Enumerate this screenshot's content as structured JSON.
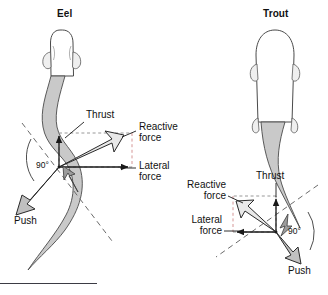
{
  "figure": {
    "background": "#ffffff",
    "ink": "#1a1a1a",
    "body_fill": "#c9c9c9",
    "body_stroke": "#4a4a4a",
    "dash_color": "#6b6b6b",
    "arrow_fill": "#b5b5b5"
  },
  "panels": [
    {
      "id": "eel",
      "title": "Eel",
      "orientation": "tail-sweeps-left",
      "labels": {
        "thrust": "Thrust",
        "reactive_line1": "Reactive",
        "reactive_line2": "force",
        "lateral_line1": "Lateral",
        "lateral_line2": "force",
        "push": "Push",
        "angle": "90°"
      }
    },
    {
      "id": "trout",
      "title": "Trout",
      "orientation": "tail-sweeps-right",
      "labels": {
        "thrust": "Thrust",
        "reactive_line1": "Reactive",
        "reactive_line2": "force",
        "lateral_line1": "Lateral",
        "lateral_line2": "force",
        "push": "Push",
        "angle": "90°"
      }
    }
  ],
  "footer": {
    "rule_present": true
  }
}
